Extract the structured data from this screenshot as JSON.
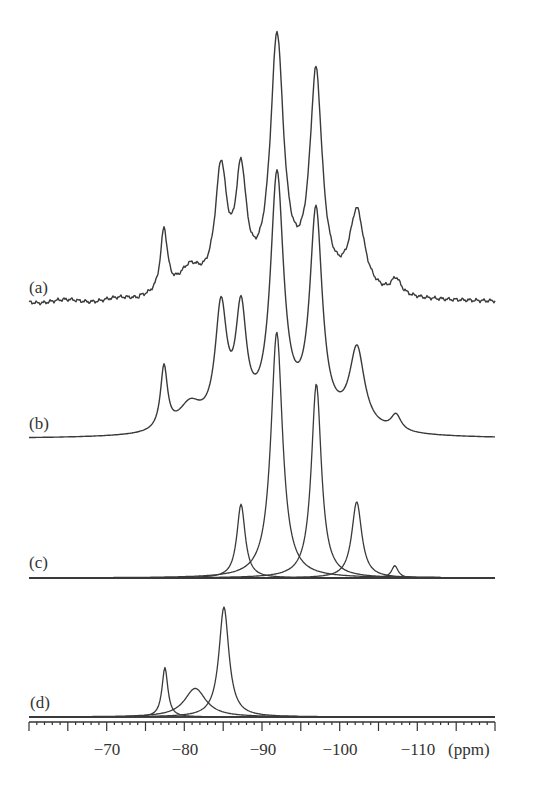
{
  "chart_data": {
    "type": "line",
    "title": "",
    "xlabel": "(ppm)",
    "ylabel": "",
    "xlim": [
      -60,
      -120
    ],
    "x_reversed": true,
    "grid": false,
    "legend": "none",
    "x_ticks": [
      -70,
      -80,
      -90,
      -100,
      -110
    ],
    "major_tick_step": 5,
    "minor_tick_step": 1,
    "traces": [
      {
        "label": "(a)",
        "kind": "experimental spectrum (noisy)",
        "baseline_y": 303,
        "peaks_ppm": [
          -77.4,
          -85.0,
          -87.2,
          -91.8,
          -96.9,
          -102.2,
          -107.1
        ],
        "peak_rel_heights": [
          0.26,
          0.56,
          0.55,
          1.0,
          0.86,
          0.35,
          0.08
        ],
        "shoulder_ppm": -81.4
      },
      {
        "label": "(b)",
        "kind": "simulated sum spectrum",
        "baseline_y": 439,
        "peaks_ppm": [
          -77.4,
          -85.0,
          -87.2,
          -91.8,
          -96.9,
          -102.2,
          -107.1
        ],
        "peak_rel_heights": [
          0.25,
          0.55,
          0.53,
          1.0,
          0.86,
          0.35,
          0.08
        ],
        "shoulder_ppm": -81.4
      },
      {
        "label": "(c)",
        "kind": "deconvoluted components",
        "baseline_y": 578,
        "components": [
          {
            "center_ppm": -87.3,
            "rel_height": 0.3
          },
          {
            "center_ppm": -91.9,
            "rel_height": 1.0
          },
          {
            "center_ppm": -97.0,
            "rel_height": 0.79
          },
          {
            "center_ppm": -102.2,
            "rel_height": 0.31
          },
          {
            "center_ppm": -107.1,
            "rel_height": 0.05
          }
        ]
      },
      {
        "label": "(d)",
        "kind": "deconvoluted components",
        "baseline_y": 717,
        "components": [
          {
            "center_ppm": -77.5,
            "rel_height": 0.45
          },
          {
            "center_ppm": -81.4,
            "rel_height": 0.26
          },
          {
            "center_ppm": -85.1,
            "rel_height": 1.0
          }
        ]
      }
    ]
  },
  "labels": {
    "a": "(a)",
    "b": "(b)",
    "c": "(c)",
    "d": "(d)",
    "unit": "(ppm)",
    "ticks": [
      "−70",
      "−80",
      "−90",
      "−100",
      "−110"
    ]
  }
}
